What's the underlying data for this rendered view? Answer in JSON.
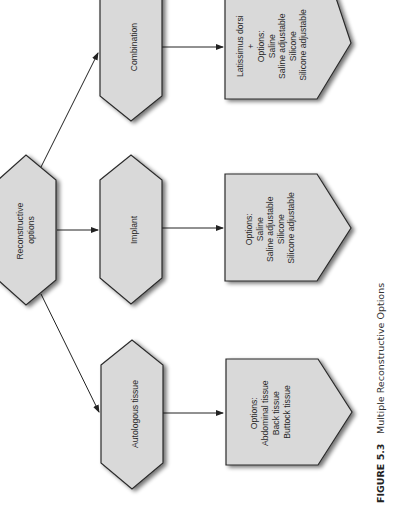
{
  "diagram": {
    "orientation": "rotated-90-ccw",
    "root": {
      "label_lines": [
        "Reconstructive",
        "options"
      ]
    },
    "branches": [
      {
        "label": "Combination",
        "options_lines": [
          "Latissimus dorsi",
          "+",
          "Options:",
          "Saline",
          "Saline adjustable",
          "Silicone",
          "Silicone adjustable"
        ]
      },
      {
        "label": "Implant",
        "options_lines": [
          "Options:",
          "Saline",
          "Saline adjustable",
          "Silicone",
          "Silicone adjustable"
        ]
      },
      {
        "label": "Autologous tissue",
        "options_lines": [
          "Options:",
          "Abdominal tissue",
          "Back tissue",
          "Buttock tissue"
        ]
      }
    ],
    "colors": {
      "node_fill": "#d9d9d9",
      "stroke": "#2b2b2b",
      "background": "#ffffff"
    }
  },
  "caption": {
    "figure_number": "FIGURE 5.3",
    "title": "Multiple Reconstructive Options"
  }
}
